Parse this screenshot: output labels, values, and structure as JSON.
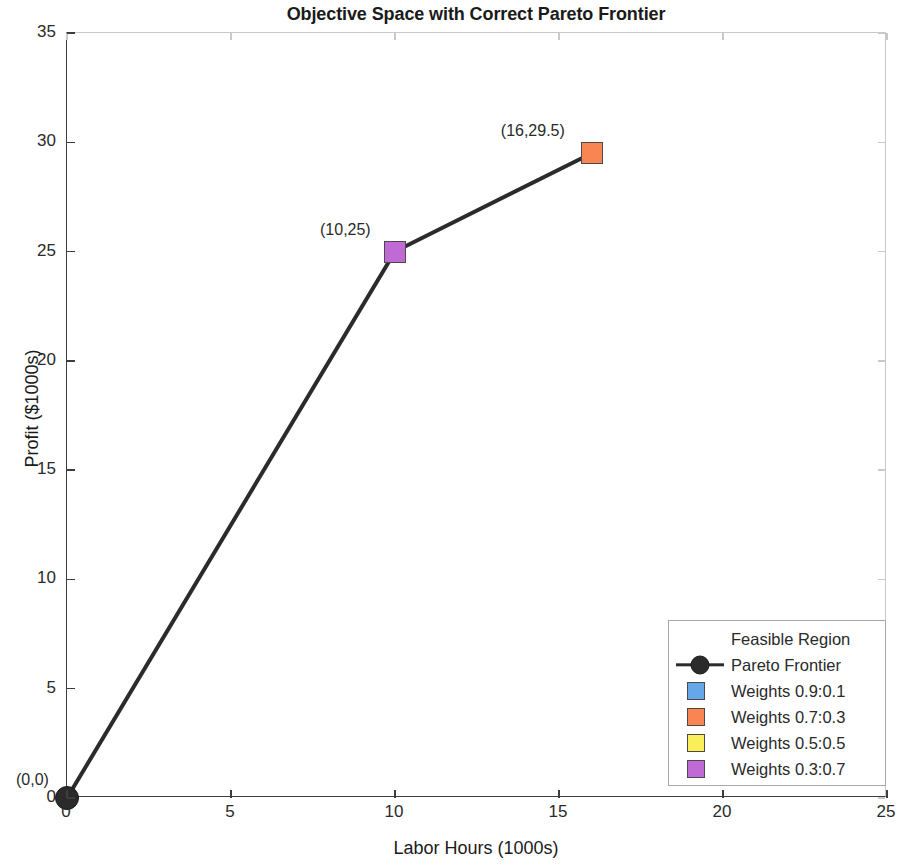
{
  "chart_data": {
    "type": "line",
    "title": "Objective Space with Correct Pareto Frontier",
    "xlabel": "Labor Hours (1000s)",
    "ylabel": "Profit ($1000s)",
    "xlim": [
      0,
      25
    ],
    "ylim": [
      0,
      35
    ],
    "xticks": [
      "0",
      "5",
      "10",
      "15",
      "20",
      "25"
    ],
    "yticks": [
      "0",
      "5",
      "10",
      "15",
      "20",
      "25",
      "30",
      "35"
    ],
    "xtick_values": [
      0,
      5,
      10,
      15,
      20,
      25
    ],
    "ytick_values": [
      0,
      5,
      10,
      15,
      20,
      25,
      30,
      35
    ],
    "grid": false,
    "legend_position": "lower right",
    "series": [
      {
        "name": "Pareto Frontier",
        "type": "line",
        "color": "#2b2b2b",
        "x": [
          0,
          10,
          16
        ],
        "y": [
          0,
          25,
          29.5
        ]
      }
    ],
    "points": [
      {
        "name": "origin-point",
        "x": 0,
        "y": 0,
        "label": "(0,0)",
        "marker": "circle",
        "color": "#2b2b2b"
      },
      {
        "name": "weights-03-07-point",
        "x": 10,
        "y": 25,
        "label": "(10,25)",
        "marker": "square",
        "color": "#C06BD5"
      },
      {
        "name": "weights-07-03-point",
        "x": 16,
        "y": 29.5,
        "label": "(16,29.5)",
        "marker": "square",
        "color": "#F98553"
      }
    ],
    "legend": [
      {
        "label": "Feasible Region",
        "marker": "none",
        "color": ""
      },
      {
        "label": "Pareto Frontier",
        "marker": "line-circle",
        "color": "#2b2b2b"
      },
      {
        "label": "Weights 0.9:0.1",
        "marker": "square",
        "color": "#65A7E8"
      },
      {
        "label": "Weights 0.7:0.3",
        "marker": "square",
        "color": "#F98553"
      },
      {
        "label": "Weights 0.5:0.5",
        "marker": "square",
        "color": "#FBEE5B"
      },
      {
        "label": "Weights 0.3:0.7",
        "marker": "square",
        "color": "#C06BD5"
      }
    ]
  }
}
